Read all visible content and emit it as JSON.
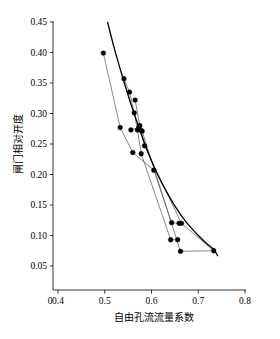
{
  "chart_data": {
    "type": "scatter",
    "title": "",
    "subtitle": "",
    "xlabel": "自由孔流流量系数",
    "ylabel": "闸门相对开度",
    "xlim": [
      0.4,
      0.8
    ],
    "ylim": [
      0.05,
      0.45
    ],
    "x_origin_label": "0",
    "xticks": [
      0.4,
      0.5,
      0.6,
      0.7,
      0.8
    ],
    "xtick_labels": [
      "0.4",
      "0.5",
      "0.6",
      "0.7",
      "0.8"
    ],
    "yticks": [
      0.05,
      0.1,
      0.15,
      0.2,
      0.25,
      0.3,
      0.35,
      0.4,
      0.45
    ],
    "ytick_labels": [
      "0.05",
      "0.10",
      "0.15",
      "0.20",
      "0.25",
      "0.30",
      "0.35",
      "0.40",
      "0.45"
    ],
    "grid": false,
    "legend": "none",
    "point_color": "#000000",
    "series_color": "#555555",
    "fit_color": "#000000",
    "series": [
      {
        "name": "series-1",
        "x": [
          0.497,
          0.533,
          0.56,
          0.605,
          0.643,
          0.659
        ],
        "y": [
          0.399,
          0.277,
          0.236,
          0.207,
          0.121,
          0.12
        ]
      },
      {
        "name": "series-2",
        "x": [
          0.541,
          0.553,
          0.563,
          0.57,
          0.578,
          0.641,
          0.656
        ],
        "y": [
          0.357,
          0.335,
          0.301,
          0.273,
          0.234,
          0.093,
          0.093
        ]
      },
      {
        "name": "series-3",
        "x": [
          0.565,
          0.575,
          0.578,
          0.585,
          0.664,
          0.733
        ],
        "y": [
          0.322,
          0.28,
          0.272,
          0.247,
          0.12,
          0.075
        ]
      },
      {
        "name": "series-4",
        "x": [
          0.556,
          0.573,
          0.58,
          0.662,
          0.733
        ],
        "y": [
          0.273,
          0.277,
          0.271,
          0.074,
          0.075
        ]
      }
    ],
    "fit_curve": {
      "name": "fitted-curve",
      "x": [
        0.506,
        0.52,
        0.535,
        0.55,
        0.565,
        0.58,
        0.596,
        0.613,
        0.632,
        0.652,
        0.673,
        0.695,
        0.715,
        0.733,
        0.742
      ],
      "y": [
        0.45,
        0.408,
        0.368,
        0.33,
        0.295,
        0.262,
        0.23,
        0.2,
        0.172,
        0.146,
        0.123,
        0.104,
        0.089,
        0.077,
        0.066
      ]
    },
    "points": [
      {
        "x": 0.497,
        "y": 0.399
      },
      {
        "x": 0.533,
        "y": 0.277
      },
      {
        "x": 0.541,
        "y": 0.357
      },
      {
        "x": 0.553,
        "y": 0.335
      },
      {
        "x": 0.556,
        "y": 0.273
      },
      {
        "x": 0.56,
        "y": 0.236
      },
      {
        "x": 0.563,
        "y": 0.301
      },
      {
        "x": 0.565,
        "y": 0.322
      },
      {
        "x": 0.57,
        "y": 0.273
      },
      {
        "x": 0.573,
        "y": 0.277
      },
      {
        "x": 0.575,
        "y": 0.28
      },
      {
        "x": 0.578,
        "y": 0.272
      },
      {
        "x": 0.578,
        "y": 0.234
      },
      {
        "x": 0.58,
        "y": 0.271
      },
      {
        "x": 0.585,
        "y": 0.247
      },
      {
        "x": 0.605,
        "y": 0.207
      },
      {
        "x": 0.641,
        "y": 0.093
      },
      {
        "x": 0.643,
        "y": 0.121
      },
      {
        "x": 0.656,
        "y": 0.093
      },
      {
        "x": 0.659,
        "y": 0.12
      },
      {
        "x": 0.662,
        "y": 0.074
      },
      {
        "x": 0.664,
        "y": 0.12
      },
      {
        "x": 0.733,
        "y": 0.075
      }
    ]
  }
}
